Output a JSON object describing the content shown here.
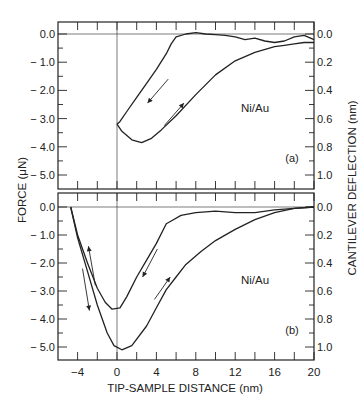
{
  "chart_data": {
    "type": "line",
    "xlabel": "TIP-SAMPLE DISTANCE (nm)",
    "ylabel_left": "FORCE (μN)",
    "ylabel_right": "CANTILEVER DEFLECTION (nm)",
    "x_ticks": [
      -4,
      0,
      4,
      8,
      12,
      16,
      20
    ],
    "xlim": [
      -6,
      20
    ],
    "left_y_ticks": [
      "0.0",
      "-1.0",
      "-2.0",
      "-3.0",
      "-4.0",
      "-5.0"
    ],
    "right_y_ticks": [
      "0.0",
      "0.2",
      "0.4",
      "0.6",
      "0.8",
      "1.0"
    ],
    "ylim": [
      -5.5,
      0.4
    ],
    "panels": [
      {
        "label": "(a)",
        "annotation": "Ni/Au",
        "series": [
          {
            "name": "approach",
            "direction": "toward surface",
            "points": [
              [
                20,
                -0.2
              ],
              [
                19,
                -0.05
              ],
              [
                18,
                -0.1
              ],
              [
                17,
                -0.25
              ],
              [
                16,
                -0.3
              ],
              [
                15,
                -0.25
              ],
              [
                14,
                -0.15
              ],
              [
                13,
                -0.2
              ],
              [
                12,
                -0.1
              ],
              [
                11,
                -0.05
              ],
              [
                10,
                -0.02
              ],
              [
                9,
                0.0
              ],
              [
                8,
                0.05
              ],
              [
                7,
                0.0
              ],
              [
                6,
                -0.1
              ],
              [
                5.5,
                -0.35
              ],
              [
                5,
                -0.7
              ],
              [
                4,
                -1.25
              ],
              [
                3,
                -1.75
              ],
              [
                2,
                -2.25
              ],
              [
                1,
                -2.75
              ],
              [
                0.3,
                -3.1
              ],
              [
                0,
                -3.2
              ]
            ]
          },
          {
            "name": "retract",
            "direction": "away from surface",
            "points": [
              [
                0,
                -3.2
              ],
              [
                0.5,
                -3.45
              ],
              [
                1.5,
                -3.75
              ],
              [
                2.5,
                -3.85
              ],
              [
                3.5,
                -3.7
              ],
              [
                4.5,
                -3.4
              ],
              [
                6,
                -2.9
              ],
              [
                8,
                -2.15
              ],
              [
                10,
                -1.45
              ],
              [
                12,
                -0.95
              ],
              [
                14,
                -0.65
              ],
              [
                16,
                -0.45
              ],
              [
                17,
                -0.4
              ],
              [
                18,
                -0.35
              ],
              [
                19,
                -0.3
              ],
              [
                20,
                -0.3
              ]
            ]
          }
        ]
      },
      {
        "label": "(b)",
        "annotation": "Ni/Au",
        "series": [
          {
            "name": "approach",
            "direction": "toward surface",
            "points": [
              [
                20,
                0.0
              ],
              [
                18,
                -0.05
              ],
              [
                16,
                -0.1
              ],
              [
                14,
                -0.2
              ],
              [
                12,
                -0.2
              ],
              [
                10,
                -0.15
              ],
              [
                8,
                -0.2
              ],
              [
                6.5,
                -0.3
              ],
              [
                5.5,
                -0.5
              ],
              [
                5,
                -0.6
              ],
              [
                4,
                -1.3
              ],
              [
                3,
                -1.9
              ],
              [
                2,
                -2.5
              ],
              [
                1,
                -3.2
              ],
              [
                0.3,
                -3.6
              ],
              [
                -0.5,
                -3.65
              ],
              [
                -1.2,
                -3.4
              ],
              [
                -2,
                -2.9
              ],
              [
                -3,
                -2.0
              ],
              [
                -4,
                -1.0
              ],
              [
                -4.7,
                0.0
              ]
            ]
          },
          {
            "name": "retract",
            "direction": "away from surface",
            "points": [
              [
                -4.7,
                0.0
              ],
              [
                -4,
                -1.1
              ],
              [
                -3,
                -2.3
              ],
              [
                -2,
                -3.5
              ],
              [
                -1,
                -4.5
              ],
              [
                -0.3,
                -4.95
              ],
              [
                0.5,
                -5.1
              ],
              [
                1.5,
                -4.95
              ],
              [
                3,
                -4.25
              ],
              [
                4,
                -3.6
              ],
              [
                5,
                -2.95
              ],
              [
                6,
                -2.5
              ],
              [
                7,
                -2.05
              ],
              [
                8.5,
                -1.6
              ],
              [
                10,
                -1.2
              ],
              [
                12,
                -0.8
              ],
              [
                14,
                -0.45
              ],
              [
                16,
                -0.2
              ],
              [
                18,
                -0.05
              ],
              [
                20,
                0.0
              ]
            ]
          }
        ]
      }
    ],
    "grid": false,
    "legend": "none"
  },
  "figure": {
    "ink_color": "#222222",
    "background": "#ffffff"
  }
}
